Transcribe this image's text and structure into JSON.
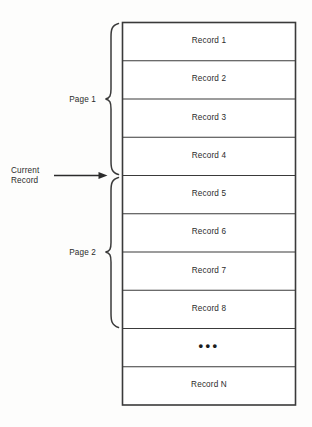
{
  "diagram": {
    "stroke_color": "#3a3a3a",
    "text_color": "#2b2b2b",
    "background_color": "#fdfdfc"
  },
  "table": {
    "rows": [
      {
        "label": "Record 1",
        "kind": "record"
      },
      {
        "label": "Record 2",
        "kind": "record"
      },
      {
        "label": "Record 3",
        "kind": "record"
      },
      {
        "label": "Record 4",
        "kind": "record"
      },
      {
        "label": "Record 5",
        "kind": "record"
      },
      {
        "label": "Record 6",
        "kind": "record"
      },
      {
        "label": "Record 7",
        "kind": "record"
      },
      {
        "label": "Record 8",
        "kind": "record"
      },
      {
        "label": "•••",
        "kind": "ellipsis"
      },
      {
        "label": "Record N",
        "kind": "record"
      }
    ]
  },
  "annotations": {
    "page1": {
      "label": "Page 1",
      "spans_rows": "1-4"
    },
    "page2": {
      "label": "Page 2",
      "spans_rows": "5-8"
    },
    "current_record": {
      "line1": "Current",
      "line2": "Record",
      "points_to": "boundary between Record 4 and Record 5"
    }
  }
}
